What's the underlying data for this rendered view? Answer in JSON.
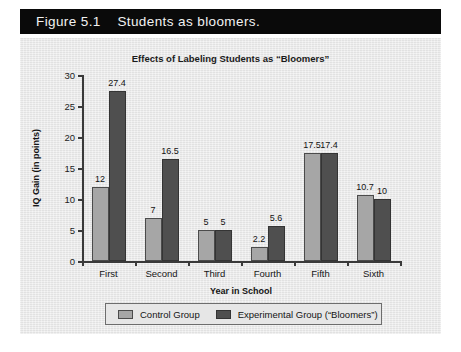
{
  "caption": {
    "figure_number": "Figure 5.1",
    "text": "Students as bloomers.",
    "full": "Figure 5.1    Students as bloomers."
  },
  "colors": {
    "banner_bg": "#0a0a0a",
    "banner_text": "#f2f2f2",
    "panel_bg": "#e9e9e9",
    "control": "#a6a6a6",
    "experimental": "#4f4f4f",
    "axis": "#3a3a3a"
  },
  "chart_data": {
    "type": "bar",
    "title": "Effects of Labeling Students as “Bloomers”",
    "xlabel": "Year in School",
    "ylabel": "IQ Gain (in points)",
    "categories": [
      "First",
      "Second",
      "Third",
      "Fourth",
      "Fifth",
      "Sixth"
    ],
    "series": [
      {
        "name": "Control Group",
        "color": "#a6a6a6",
        "values": [
          12,
          7,
          5,
          2.2,
          17.5,
          10.7
        ],
        "labels": [
          "12",
          "7",
          "5",
          "2.2",
          "17.5",
          "10.7"
        ]
      },
      {
        "name": "Experimental Group (“Bloomers”)",
        "color": "#4f4f4f",
        "values": [
          27.4,
          16.5,
          5,
          5.6,
          17.4,
          10
        ],
        "labels": [
          "27.4",
          "16.5",
          "5",
          "5.6",
          "17.4",
          "10"
        ]
      }
    ],
    "ylim": [
      0,
      30
    ],
    "yticks": [
      0,
      5,
      10,
      15,
      20,
      25,
      30
    ],
    "ytick_labels": [
      "0",
      "5",
      "10",
      "15",
      "20",
      "25",
      "30"
    ],
    "grid": false,
    "legend_position": "bottom"
  },
  "legend": {
    "items": [
      {
        "label": "Control Group",
        "swatch": "control"
      },
      {
        "label": "Experimental Group (“Bloomers”)",
        "swatch": "experimental"
      }
    ]
  }
}
